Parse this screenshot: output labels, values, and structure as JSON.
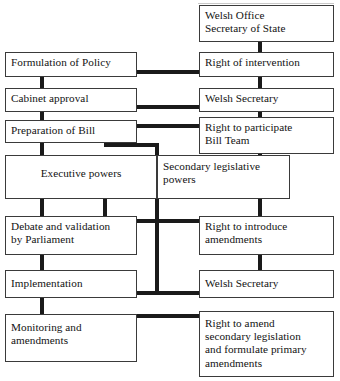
{
  "diagram": {
    "type": "flowchart",
    "boxes": [
      {
        "id": "welsh-office-secretary-of-state",
        "text": "Welsh Office\nSecretary of State"
      },
      {
        "id": "formulation-of-policy",
        "text": "Formulation of Policy"
      },
      {
        "id": "right-of-intervention",
        "text": "Right of intervention"
      },
      {
        "id": "cabinet-approval",
        "text": "Cabinet approval"
      },
      {
        "id": "welsh-secretary-top",
        "text": "Welsh Secretary"
      },
      {
        "id": "preparation-of-bill",
        "text": "Preparation of Bill"
      },
      {
        "id": "right-to-participate-bill-team",
        "text": "Right to participate\nBill Team"
      },
      {
        "id": "executive-powers",
        "text": "Executive powers"
      },
      {
        "id": "secondary-legislative-powers",
        "text": "Secondary legislative\npowers"
      },
      {
        "id": "debate-and-validation-by-parliament",
        "text": "Debate and validation\nby Parliament"
      },
      {
        "id": "right-to-introduce-amendments",
        "text": "Right to introduce\namendments"
      },
      {
        "id": "implementation",
        "text": "Implementation"
      },
      {
        "id": "welsh-secretary-bottom",
        "text": "Welsh Secretary"
      },
      {
        "id": "monitoring-and-amendments",
        "text": "Monitoring and\namendments"
      },
      {
        "id": "right-to-amend-secondary-legislation",
        "text": "Right to amend\nsecondary legislation\nand formulate primary\namendments"
      }
    ],
    "colors": {
      "box_border": "#3a3a3a",
      "connector": "#1a1a1a",
      "background": "#ffffff",
      "text": "#121212"
    }
  }
}
